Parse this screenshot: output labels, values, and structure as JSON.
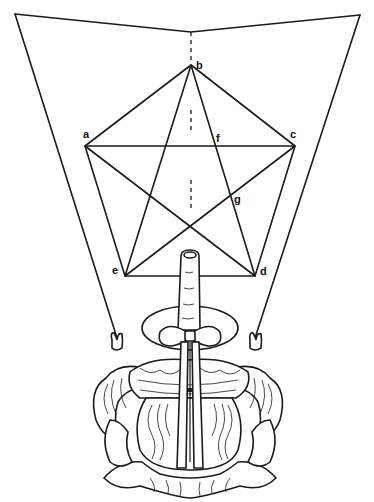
{
  "diagram": {
    "type": "geometric construction illustration",
    "colors": {
      "ink": "#1a1a1a",
      "background": "#ffffff"
    },
    "labels": {
      "a": "a",
      "b": "b",
      "c": "c",
      "d": "d",
      "e": "e",
      "f": "f",
      "g": "g"
    },
    "points": {
      "a": [
        85,
        146
      ],
      "b": [
        191,
        65
      ],
      "c": [
        295,
        146
      ],
      "d": [
        255,
        276
      ],
      "e": [
        125,
        276
      ],
      "f": [
        218,
        146
      ],
      "g": [
        232,
        199
      ]
    },
    "frame": {
      "top_left": [
        15,
        14
      ],
      "valley": [
        191,
        32
      ],
      "top_right": [
        360,
        15
      ],
      "left_hand": [
        117,
        340
      ],
      "right_hand": [
        255,
        340
      ]
    }
  }
}
